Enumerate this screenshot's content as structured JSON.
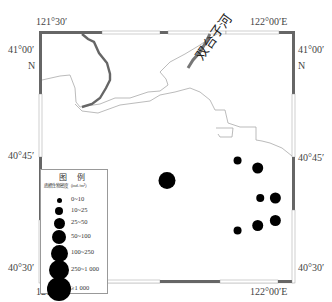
{
  "map": {
    "top_labels": {
      "left_lon": "121°30′",
      "right_lon": "122°00′E"
    },
    "bottom_labels": {
      "left_lon": "121°30′",
      "right_lon": "122°00′E"
    },
    "left_labels": {
      "lat_top": "41°00′",
      "lat_top_n": "N",
      "lat_mid": "40°45′",
      "lat_bottom": "40°30′"
    },
    "right_labels": {
      "lat_top": "41°00′",
      "lat_top_n": "N",
      "lat_mid": "40°45′",
      "lat_bottom": "40°30′"
    },
    "river_label": "双台子河",
    "frame_color": "#666666",
    "river_color": "#666666",
    "coast_color": "#aaaaaa"
  },
  "legend": {
    "title": "图 例",
    "unit": "底栖生物密度（ind./m²）",
    "classes": [
      {
        "label": "0~10",
        "size_rank": 1
      },
      {
        "label": "10~25",
        "size_rank": 2
      },
      {
        "label": "25~50",
        "size_rank": 3
      },
      {
        "label": "50~100",
        "size_rank": 4
      },
      {
        "label": "100~250",
        "size_rank": 5
      },
      {
        "label": "250~1 000",
        "size_rank": 6
      },
      {
        "label": "≥1 000",
        "size_rank": 7
      }
    ]
  },
  "stations": [
    {
      "id": 1,
      "class": "100~250",
      "size_rank": 5,
      "lon_frac": 0.5,
      "lat_frac": 0.41
    },
    {
      "id": 2,
      "class": "10~25",
      "size_rank": 2,
      "lon_frac": 0.78,
      "lat_frac": 0.49
    },
    {
      "id": 3,
      "class": "25~50",
      "size_rank": 3,
      "lon_frac": 0.86,
      "lat_frac": 0.46
    },
    {
      "id": 4,
      "class": "10~25",
      "size_rank": 2,
      "lon_frac": 0.87,
      "lat_frac": 0.34
    },
    {
      "id": 5,
      "class": "25~50",
      "size_rank": 3,
      "lon_frac": 0.93,
      "lat_frac": 0.34
    },
    {
      "id": 6,
      "class": "10~25",
      "size_rank": 2,
      "lon_frac": 0.78,
      "lat_frac": 0.21
    },
    {
      "id": 7,
      "class": "25~50",
      "size_rank": 3,
      "lon_frac": 0.86,
      "lat_frac": 0.23
    },
    {
      "id": 8,
      "class": "25~50",
      "size_rank": 3,
      "lon_frac": 0.93,
      "lat_frac": 0.25
    }
  ]
}
